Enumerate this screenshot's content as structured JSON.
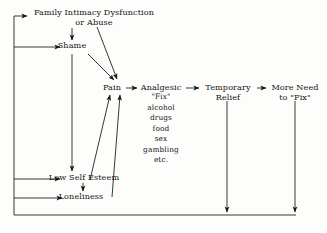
{
  "diagram": {
    "type": "flowchart",
    "ink_color": "#141414",
    "background_color": "#fdfdfb",
    "nodes": {
      "root": "Family Intimacy Dysfunction\nor Abuse",
      "shame": "Shame",
      "pain": "Pain",
      "analgesic": "Analgesic",
      "analgesic_list": "\"Fix\"\nalcohol\ndrugs\nfood\nsex\ngambling\netc.",
      "temporary_relief": "Temporary\nRelief",
      "more_need": "More Need\nto \"Fix\"",
      "low_self_esteem": "Low Self Esteem",
      "loneliness": "Loneliness"
    },
    "edges": [
      {
        "from": "root",
        "to": "shame",
        "style": "vertical-arrow"
      },
      {
        "from": "root",
        "to": "pain",
        "style": "diagonal-arrow"
      },
      {
        "from": "shame",
        "to": "pain",
        "style": "diagonal-arrow"
      },
      {
        "from": "shame",
        "to": "low_self_esteem",
        "style": "vertical-arrow"
      },
      {
        "from": "low_self_esteem",
        "to": "loneliness",
        "style": "vertical-arrow"
      },
      {
        "from": "low_self_esteem",
        "to": "pain",
        "style": "diagonal-arrow"
      },
      {
        "from": "loneliness",
        "to": "pain",
        "style": "diagonal-arrow"
      },
      {
        "from": "pain",
        "to": "analgesic",
        "style": "horizontal-arrow"
      },
      {
        "from": "analgesic",
        "to": "temporary_relief",
        "style": "horizontal-arrow"
      },
      {
        "from": "temporary_relief",
        "to": "more_need",
        "style": "horizontal-arrow"
      },
      {
        "from": "temporary_relief",
        "to": "feedback_bus",
        "style": "vertical-arrow"
      },
      {
        "from": "more_need",
        "to": "feedback_bus",
        "style": "vertical-arrow"
      },
      {
        "from": "feedback_bus",
        "to": "root",
        "style": "loop-arrow"
      },
      {
        "from": "feedback_bus",
        "to": "shame",
        "style": "loop-arrow"
      },
      {
        "from": "feedback_bus",
        "to": "low_self_esteem",
        "style": "loop-arrow"
      },
      {
        "from": "feedback_bus",
        "to": "loneliness",
        "style": "loop-arrow"
      }
    ]
  }
}
